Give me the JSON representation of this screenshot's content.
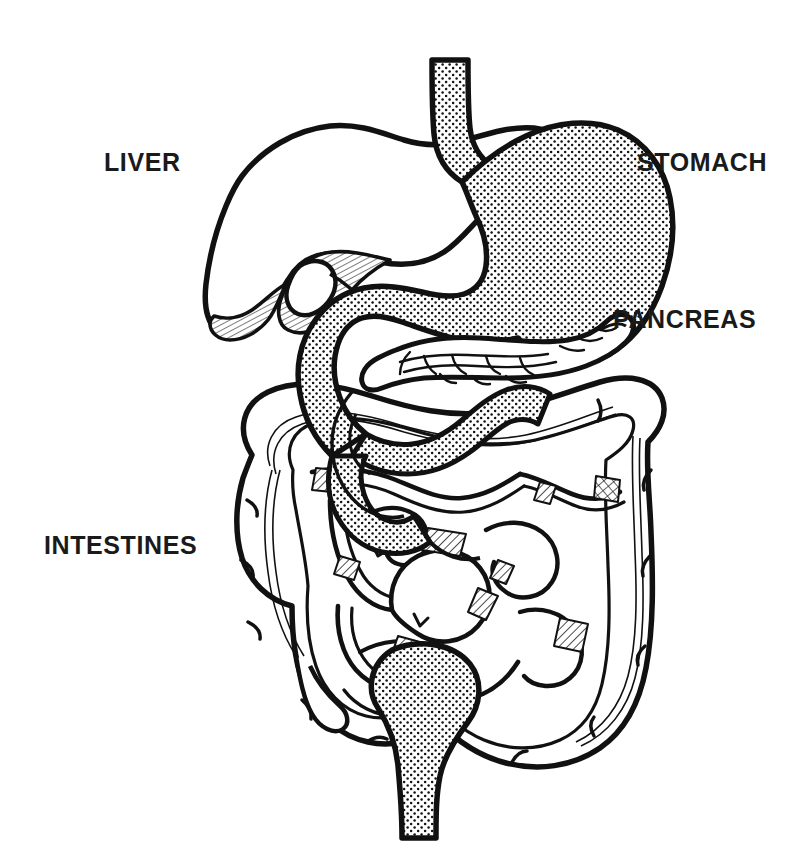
{
  "figure": {
    "style": "black-and-white line drawing",
    "background_color": "#ffffff",
    "ink_color": "#111111",
    "labels": [
      {
        "id": "liver",
        "text": "LIVER",
        "x": 104,
        "y": 150
      },
      {
        "id": "stomach",
        "text": "STOMACH",
        "x": 637,
        "y": 150
      },
      {
        "id": "pancreas",
        "text": "PANCREAS",
        "x": 613,
        "y": 307
      },
      {
        "id": "intestines",
        "text": "INTESTINES",
        "x": 44,
        "y": 533
      }
    ],
    "organs": [
      {
        "name": "esophagus",
        "fill": "stipple",
        "label": "STOMACH"
      },
      {
        "name": "stomach",
        "fill": "stipple",
        "label": "STOMACH"
      },
      {
        "name": "liver",
        "fill": "white",
        "label": "LIVER"
      },
      {
        "name": "gallbladder",
        "fill": "white",
        "label": "LIVER"
      },
      {
        "name": "liver-underside",
        "fill": "cross-hatch",
        "label": "LIVER"
      },
      {
        "name": "duodenum",
        "fill": "stipple",
        "label": "PANCREAS"
      },
      {
        "name": "pancreas",
        "fill": "white-lobular",
        "label": "PANCREAS"
      },
      {
        "name": "large-intestine",
        "fill": "white",
        "label": "INTESTINES"
      },
      {
        "name": "small-intestine",
        "fill": "white",
        "label": "INTESTINES"
      },
      {
        "name": "appendix",
        "fill": "white",
        "label": "INTESTINES"
      },
      {
        "name": "rectum",
        "fill": "stipple",
        "label": "INTESTINES"
      }
    ]
  }
}
